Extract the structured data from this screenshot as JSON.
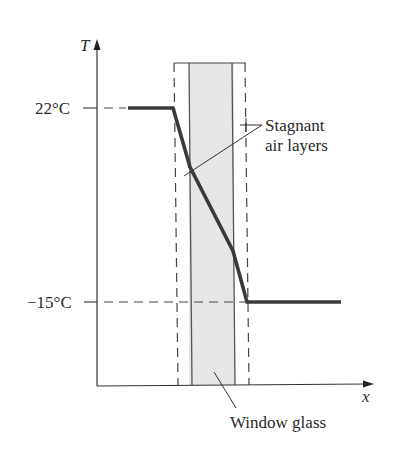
{
  "diagram": {
    "y_axis_label": "T",
    "x_axis_label": "x",
    "temperatures": {
      "inside": "22°C",
      "outside": "−15°C"
    },
    "callouts": {
      "stagnant_line1": "Stagnant",
      "stagnant_line2": "air layers",
      "glass": "Window glass"
    },
    "colors": {
      "profile_line": "#3a3a3a",
      "glass_fill": "#e4e4e4",
      "axis": "#333333",
      "dashed": "#444444"
    },
    "profile_points": [
      [
        128,
        108
      ],
      [
        173,
        108
      ],
      [
        190,
        167
      ],
      [
        233,
        251
      ],
      [
        247,
        302
      ],
      [
        341,
        302
      ]
    ]
  }
}
